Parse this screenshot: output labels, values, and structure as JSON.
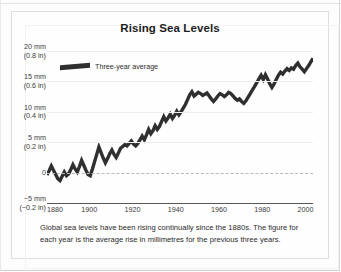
{
  "figure": {
    "title": "Rising Sea Levels",
    "caption": "Global sea levels have been rising continually since the 1880s. The figure for each year is the average rise in millimetres for the previous three years."
  },
  "legend": {
    "series_label": "Three-year average",
    "swatch_icon": "thick-line-swatch"
  },
  "axes": {
    "y_ticks": [
      {
        "mm": "20 mm",
        "inch": "(0.8 in)",
        "value": 20
      },
      {
        "mm": "15 mm",
        "inch": "(0.6 in)",
        "value": 15
      },
      {
        "mm": "10 mm",
        "inch": "(0.4 in)",
        "value": 10
      },
      {
        "mm": "5 mm",
        "inch": "(0.2 in)",
        "value": 5
      },
      {
        "mm": "0",
        "inch": "",
        "value": 0
      },
      {
        "mm": "−5 mm",
        "inch": "(−0.2 in)",
        "value": -5
      }
    ],
    "x_ticks": [
      "1880",
      "1900",
      "1920",
      "1940",
      "1960",
      "1980",
      "2000"
    ]
  },
  "colors": {
    "line": "#2f2f2f",
    "grid": "#ededed",
    "zero_line": "#b9b9b9",
    "axis": "#575757",
    "text": "#2a2a2a",
    "card_bg": "#fefefe",
    "card_border": "#dedede"
  },
  "chart_data": {
    "type": "line",
    "title": "Rising Sea Levels",
    "subtitle": "",
    "xlabel": "",
    "ylabel": "Sea level rise (mm)",
    "ylabel_secondary": "Sea level rise (in)",
    "xlim": [
      1880,
      2003
    ],
    "ylim": [
      -5,
      20
    ],
    "y_gridlines": [
      5,
      10,
      15,
      20
    ],
    "y_zero_line": 0,
    "grid": true,
    "legend_position": "top-left-inside",
    "units": {
      "primary": "mm",
      "secondary": "in",
      "conversion": "5 mm = 0.2 in"
    },
    "annotations": [
      "Global sea levels have been rising continually since the 1880s.",
      "The figure for each year is the average rise in millimetres for the previous three years."
    ],
    "series": [
      {
        "name": "Three-year average",
        "color": "#2f2f2f",
        "x": [
          1880,
          1881,
          1882,
          1883,
          1884,
          1885,
          1886,
          1887,
          1888,
          1889,
          1890,
          1891,
          1892,
          1893,
          1894,
          1895,
          1896,
          1897,
          1898,
          1899,
          1900,
          1901,
          1902,
          1903,
          1904,
          1905,
          1906,
          1907,
          1908,
          1909,
          1910,
          1911,
          1912,
          1913,
          1914,
          1915,
          1916,
          1917,
          1918,
          1919,
          1920,
          1921,
          1922,
          1923,
          1924,
          1925,
          1926,
          1927,
          1928,
          1929,
          1930,
          1931,
          1932,
          1933,
          1934,
          1935,
          1936,
          1937,
          1938,
          1939,
          1940,
          1941,
          1942,
          1943,
          1944,
          1945,
          1946,
          1947,
          1948,
          1949,
          1950,
          1951,
          1952,
          1953,
          1954,
          1955,
          1956,
          1957,
          1958,
          1959,
          1960,
          1961,
          1962,
          1963,
          1964,
          1965,
          1966,
          1967,
          1968,
          1969,
          1970,
          1971,
          1972,
          1973,
          1974,
          1975,
          1976,
          1977,
          1978,
          1979,
          1980,
          1981,
          1982,
          1983,
          1984,
          1985,
          1986,
          1987,
          1988,
          1989,
          1990,
          1991,
          1992,
          1993,
          1994,
          1995,
          1996,
          1997,
          1998,
          1999,
          2000,
          2001,
          2002,
          2003
        ],
        "values": [
          -0.4,
          0.3,
          1.1,
          0.4,
          -0.3,
          -1.0,
          -1.3,
          -0.6,
          0.1,
          -0.5,
          -0.2,
          0.5,
          1.3,
          0.6,
          0.1,
          1.0,
          2.0,
          1.2,
          0.4,
          -0.3,
          -0.5,
          0.6,
          1.8,
          3.0,
          4.2,
          3.3,
          2.4,
          1.6,
          2.3,
          3.1,
          3.7,
          3.0,
          2.5,
          3.2,
          4.0,
          4.3,
          4.6,
          4.4,
          4.8,
          5.2,
          4.7,
          4.4,
          4.8,
          5.4,
          6.0,
          5.4,
          6.2,
          7.1,
          6.4,
          6.9,
          7.7,
          7.1,
          7.6,
          8.4,
          9.2,
          8.5,
          9.0,
          9.6,
          8.9,
          9.4,
          10.1,
          9.5,
          10.0,
          10.6,
          11.2,
          12.0,
          12.8,
          13.3,
          12.6,
          12.9,
          13.2,
          13.0,
          12.7,
          12.9,
          13.1,
          12.6,
          12.1,
          11.7,
          12.1,
          12.6,
          13.0,
          12.8,
          12.5,
          12.8,
          13.2,
          13.0,
          12.6,
          12.2,
          11.9,
          12.1,
          11.7,
          11.4,
          11.8,
          12.4,
          13.0,
          13.6,
          14.2,
          14.8,
          15.4,
          16.0,
          15.3,
          16.1,
          15.4,
          14.6,
          14.0,
          14.6,
          15.3,
          16.0,
          16.5,
          16.2,
          16.7,
          17.1,
          16.8,
          17.2,
          17.0,
          17.6,
          18.0,
          17.4,
          17.0,
          16.6,
          17.1,
          17.6,
          18.2,
          18.8
        ]
      }
    ]
  }
}
